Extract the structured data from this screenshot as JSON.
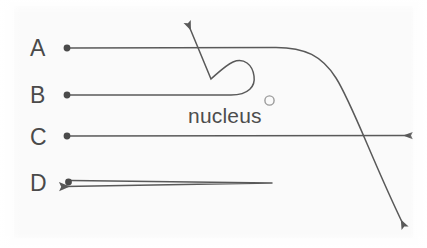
{
  "figure": {
    "type": "particle-deflection-diagram",
    "title": "",
    "background_color": "#fafafa",
    "stroke_color": "#595959",
    "text_color": "#4a4a4a",
    "width": 427,
    "height": 248
  },
  "nucleus": {
    "label": "nucleus",
    "label_x": 188,
    "label_y": 105,
    "marker_icon": "open-circle-icon",
    "marker_x": 269.5,
    "marker_y": 100.5,
    "marker_radius": 4.6
  },
  "tracks": [
    {
      "id": "A",
      "label": "A",
      "label_x": 30,
      "label_y": 37,
      "start_dot_x": 67,
      "start_dot_y": 48,
      "description": "Enters horizontally, bends sharply downward on the far right and exits the bottom-right corner.",
      "arrow_end_x": 405,
      "arrow_end_y": 227,
      "arrow_direction": "down-right"
    },
    {
      "id": "B",
      "label": "B",
      "label_x": 30,
      "label_y": 84,
      "start_dot_x": 67,
      "start_dot_y": 95,
      "description": "Enters horizontally, makes a tight U-turn and exits back toward the upper left.",
      "arrow_end_x": 185,
      "arrow_end_y": 22,
      "arrow_direction": "up-left"
    },
    {
      "id": "C",
      "label": "C",
      "label_x": 30,
      "label_y": 126,
      "start_dot_x": 67,
      "start_dot_y": 136,
      "description": "Passes straight through undeflected and exits to the right.",
      "arrow_end_x": 415,
      "arrow_end_y": 136,
      "arrow_direction": "right"
    },
    {
      "id": "D",
      "label": "D",
      "label_x": 30,
      "label_y": 172,
      "start_dot_x": 68,
      "start_dot_y": 182,
      "description": "Travels right, turns completely around at a point and returns back to the left.",
      "arrow_end_x": 58,
      "arrow_end_y": 187,
      "arrow_direction": "left",
      "turnaround_x": 272,
      "turnaround_y": 183
    }
  ]
}
